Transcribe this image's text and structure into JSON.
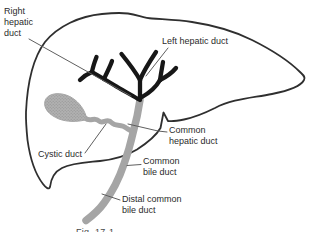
{
  "caption": "Fig. 17-1",
  "labels": {
    "right_hepatic_duct": "Right\nhepatic\nduct",
    "left_hepatic_duct": "Left hepatic duct",
    "common_hepatic_duct": "Common\nhepatic duct",
    "cystic_duct": "Cystic duct",
    "common_bile_duct": "Common\nbile duct",
    "distal_common_bile_duct": "Distal common\nbile duct"
  },
  "colors": {
    "background": "#ffffff",
    "liver_outline": "#2f2f2f",
    "hepatic_duct_dark": "#171717",
    "bile_duct_gray": "#a5a5a5",
    "gallbladder_fill": "#b1b1b1",
    "gallbladder_dot": "#8e8e8e",
    "leader_line": "#5f5f5f",
    "label_text": "#2b2b2b"
  }
}
